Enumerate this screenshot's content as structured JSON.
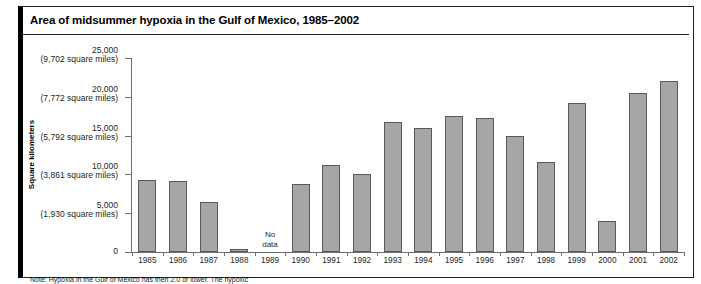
{
  "figure": {
    "title": "Area of midsummer hypoxia in the Gulf of Mexico, 1985–2002",
    "note": "Note: Hypoxia in the Gulf of Mexico has then 2.0 or lower. The hypoxic"
  },
  "chart_data": {
    "type": "bar",
    "title": "Area of midsummer hypoxia in the Gulf of Mexico, 1985–2002",
    "xlabel": "",
    "ylabel": "Square kilometers",
    "ylim": [
      0,
      25000
    ],
    "grid": false,
    "legend": null,
    "categories": [
      "1985",
      "1986",
      "1987",
      "1988",
      "1989",
      "1990",
      "1991",
      "1992",
      "1993",
      "1994",
      "1995",
      "1996",
      "1997",
      "1998",
      "1999",
      "2000",
      "2001",
      "2002"
    ],
    "values": [
      9300,
      9100,
      6400,
      400,
      null,
      8800,
      11200,
      10100,
      16800,
      16000,
      17500,
      17300,
      15000,
      11600,
      19200,
      4000,
      20500,
      22000
    ],
    "missing_label": "No\ndata",
    "missing_label_line1": "No",
    "missing_label_line2": "data",
    "missing_category": "1989",
    "yticks": [
      {
        "value": 25000,
        "label": "25,000",
        "sublabel": "(9,702 square miles)"
      },
      {
        "value": 20000,
        "label": "20,000",
        "sublabel": "(7,772 square miles)"
      },
      {
        "value": 15000,
        "label": "15,000",
        "sublabel": "(5,792 square miles)"
      },
      {
        "value": 10000,
        "label": "10,000",
        "sublabel": "(3,861 square miles)"
      },
      {
        "value": 5000,
        "label": "5,000",
        "sublabel": "(1,930 square miles)"
      },
      {
        "value": 0,
        "label": "0",
        "sublabel": ""
      }
    ],
    "colors": {
      "bar_fill": "#a6a6a6",
      "bar_stroke": "#58595b",
      "axis": "#6d6e71",
      "text": "#231f20",
      "frame": "#231f20"
    }
  }
}
